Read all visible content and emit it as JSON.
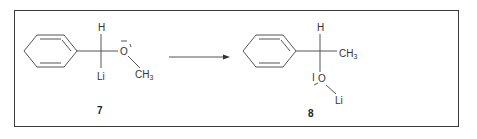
{
  "diagram": {
    "type": "chemical-reaction-scheme",
    "reactant": {
      "compound_number": "7",
      "atoms": {
        "top_substituent": "H",
        "bottom_substituent": "Li",
        "oxygen": "O",
        "oxygen_charge": "−",
        "methyl": "CH",
        "methyl_subscript": "3"
      },
      "ring": "phenyl"
    },
    "arrow": {
      "direction": "right"
    },
    "product": {
      "compound_number": "8",
      "atoms": {
        "top_substituent": "H",
        "side_substituent": "CH",
        "side_subscript": "3",
        "oxygen": "O",
        "metal": "Li"
      },
      "ring": "phenyl"
    }
  }
}
